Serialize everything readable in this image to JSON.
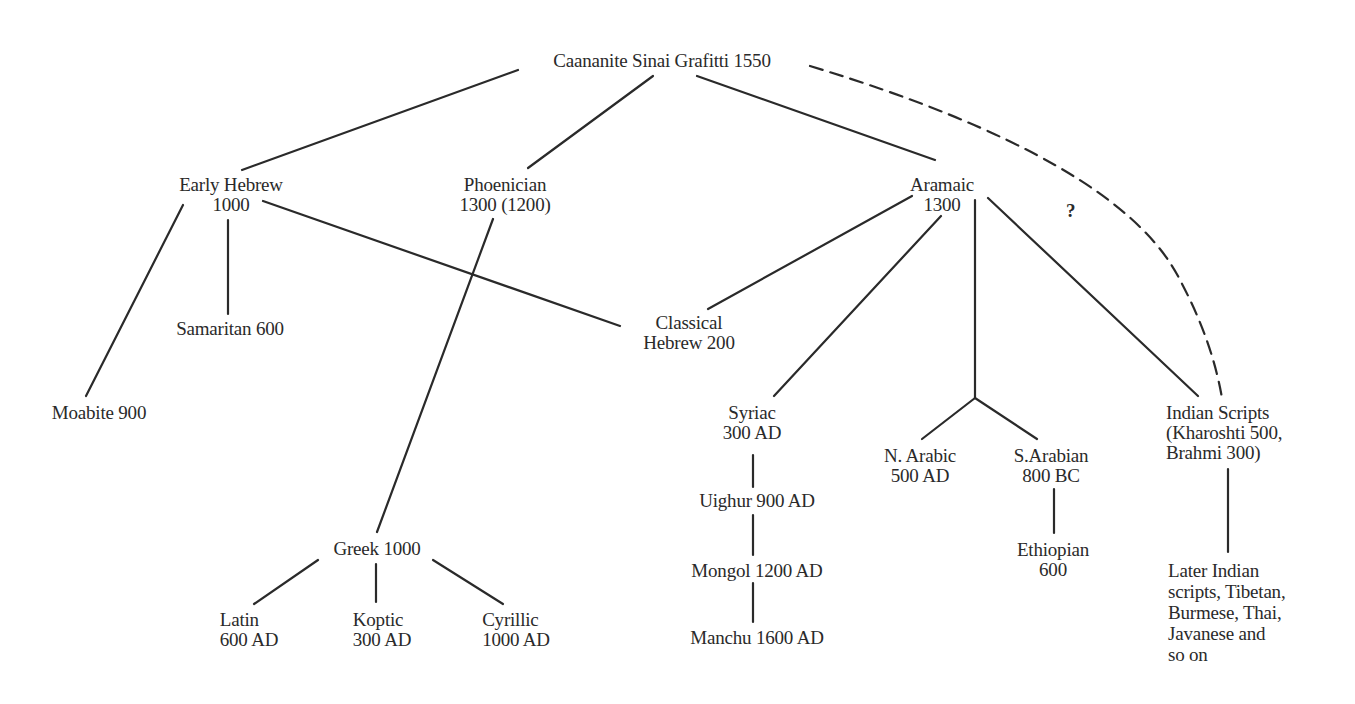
{
  "diagram": {
    "type": "tree",
    "nodes": {
      "root": {
        "lines": [
          "Caananite Sinai Grafitti 1550"
        ]
      },
      "early_hebrew": {
        "lines": [
          "Early Hebrew",
          "1000"
        ]
      },
      "phoenician": {
        "lines": [
          "Phoenician",
          "1300 (1200)"
        ]
      },
      "aramaic": {
        "lines": [
          "Aramaic",
          "1300"
        ]
      },
      "samaritan": {
        "lines": [
          "Samaritan 600"
        ]
      },
      "moabite": {
        "lines": [
          "Moabite 900"
        ]
      },
      "classical_hebrew": {
        "lines": [
          "Classical",
          "Hebrew 200"
        ]
      },
      "syriac": {
        "lines": [
          "Syriac",
          "300 AD"
        ]
      },
      "uighur": {
        "lines": [
          "Uighur 900 AD"
        ]
      },
      "mongol": {
        "lines": [
          "Mongol 1200 AD"
        ]
      },
      "manchu": {
        "lines": [
          "Manchu 1600 AD"
        ]
      },
      "n_arabic": {
        "lines": [
          "N. Arabic",
          "500 AD"
        ]
      },
      "s_arabian": {
        "lines": [
          "S.Arabian",
          "800 BC"
        ]
      },
      "ethiopian": {
        "lines": [
          "Ethiopian",
          "600"
        ]
      },
      "indian_scripts": {
        "lines": [
          "Indian Scripts",
          "(Kharoshti 500,",
          "Brahmi 300)"
        ]
      },
      "later_indian": {
        "lines": [
          "Later Indian",
          "scripts, Tibetan,",
          "Burmese, Thai,",
          "Javanese and",
          "so on"
        ]
      },
      "greek": {
        "lines": [
          "Greek 1000"
        ]
      },
      "latin": {
        "lines": [
          "Latin",
          "600 AD"
        ]
      },
      "koptic": {
        "lines": [
          "Koptic",
          "300 AD"
        ]
      },
      "cyrillic": {
        "lines": [
          "Cyrillic",
          "1000 AD"
        ]
      }
    },
    "uncertain_marker": "?",
    "edges": [
      {
        "from": "root",
        "to": "early_hebrew",
        "style": "solid"
      },
      {
        "from": "root",
        "to": "phoenician",
        "style": "solid"
      },
      {
        "from": "root",
        "to": "aramaic",
        "style": "solid"
      },
      {
        "from": "root",
        "to": "indian_scripts",
        "style": "dashed",
        "label": "?"
      },
      {
        "from": "early_hebrew",
        "to": "moabite",
        "style": "solid"
      },
      {
        "from": "early_hebrew",
        "to": "samaritan",
        "style": "solid"
      },
      {
        "from": "early_hebrew",
        "to": "classical_hebrew",
        "style": "solid"
      },
      {
        "from": "phoenician",
        "to": "greek",
        "style": "solid"
      },
      {
        "from": "aramaic",
        "to": "classical_hebrew",
        "style": "solid"
      },
      {
        "from": "aramaic",
        "to": "syriac",
        "style": "solid"
      },
      {
        "from": "aramaic",
        "to": "n_arabic",
        "style": "solid"
      },
      {
        "from": "aramaic",
        "to": "s_arabian",
        "style": "solid"
      },
      {
        "from": "aramaic",
        "to": "indian_scripts",
        "style": "solid"
      },
      {
        "from": "syriac",
        "to": "uighur",
        "style": "solid"
      },
      {
        "from": "uighur",
        "to": "mongol",
        "style": "solid"
      },
      {
        "from": "mongol",
        "to": "manchu",
        "style": "solid"
      },
      {
        "from": "s_arabian",
        "to": "ethiopian",
        "style": "solid"
      },
      {
        "from": "indian_scripts",
        "to": "later_indian",
        "style": "solid"
      },
      {
        "from": "greek",
        "to": "latin",
        "style": "solid"
      },
      {
        "from": "greek",
        "to": "koptic",
        "style": "solid"
      },
      {
        "from": "greek",
        "to": "cyrillic",
        "style": "solid"
      }
    ],
    "colors": {
      "ink": "#2a2a2a",
      "background": "#ffffff"
    }
  }
}
